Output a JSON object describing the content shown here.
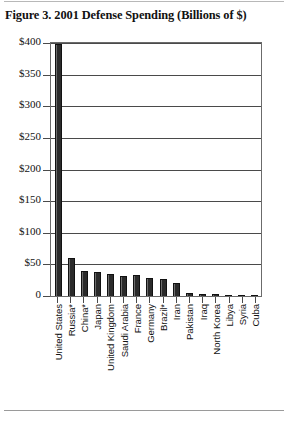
{
  "figure": {
    "title": "Figure 3. 2001 Defense Spending (Billions of $)"
  },
  "chart_data": {
    "type": "bar",
    "title": "Figure 3. 2001 Defense Spending (Billions of $)",
    "xlabel": "",
    "ylabel": "",
    "ylim": [
      0,
      400
    ],
    "ytick_labels": [
      "$400",
      "$350",
      "$300",
      "$250",
      "$200",
      "$150",
      "$100",
      "$50",
      "0"
    ],
    "ytick_values": [
      400,
      350,
      300,
      250,
      200,
      150,
      100,
      50,
      0
    ],
    "grid": "horizontal",
    "legend": "none",
    "units": "Billions of $",
    "note": "* indicates estimated figure",
    "categories": [
      "United States",
      "Russia*",
      "China*",
      "Japan",
      "United Kingdom",
      "Saudi Arabia",
      "France",
      "Germany",
      "Brazil*",
      "Iran",
      "Pakistan",
      "Iraq",
      "North Korea",
      "Libya",
      "Syria",
      "Cuba"
    ],
    "values": [
      399,
      60,
      40,
      38,
      35,
      31,
      33,
      28,
      27,
      20,
      4,
      3,
      3,
      2,
      2,
      1
    ]
  }
}
